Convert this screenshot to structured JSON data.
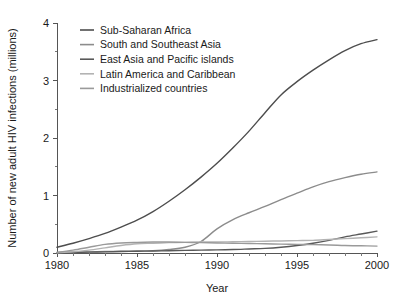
{
  "chart_data": {
    "type": "line",
    "title": "",
    "xlabel": "Year",
    "ylabel": "Number of new adult HIV infections (millions)",
    "xlim": [
      1980,
      2000
    ],
    "ylim": [
      0,
      4
    ],
    "grid": false,
    "legend_position": "top-left",
    "x_ticks": [
      "1980",
      "1985",
      "1990",
      "1995",
      "2000"
    ],
    "x_tick_values": [
      1980,
      1985,
      1990,
      1995,
      2000
    ],
    "x_minor_step": 1,
    "y_ticks": [
      "0",
      "1",
      "2",
      "3",
      "4"
    ],
    "y_tick_values": [
      0,
      1,
      2,
      3,
      4
    ],
    "y_minor_step": 0.5,
    "x": [
      1980,
      1981,
      1982,
      1983,
      1984,
      1985,
      1986,
      1987,
      1988,
      1989,
      1990,
      1991,
      1992,
      1993,
      1994,
      1995,
      1996,
      1997,
      1998,
      1999,
      2000
    ],
    "series": [
      {
        "name": "Sub-Saharan Africa",
        "color": "#4d4d4d",
        "values": [
          0.1,
          0.17,
          0.25,
          0.34,
          0.45,
          0.57,
          0.72,
          0.9,
          1.1,
          1.32,
          1.56,
          1.83,
          2.12,
          2.44,
          2.75,
          2.98,
          3.18,
          3.36,
          3.52,
          3.64,
          3.71
        ]
      },
      {
        "name": "South and Southeast Asia",
        "color": "#8c8c8c",
        "values": [
          0.01,
          0.015,
          0.02,
          0.025,
          0.03,
          0.035,
          0.04,
          0.06,
          0.1,
          0.2,
          0.42,
          0.58,
          0.7,
          0.81,
          0.93,
          1.04,
          1.15,
          1.24,
          1.31,
          1.37,
          1.41
        ]
      },
      {
        "name": "East Asia and Pacific islands",
        "color": "#595959",
        "values": [
          0.005,
          0.01,
          0.015,
          0.02,
          0.025,
          0.03,
          0.035,
          0.04,
          0.045,
          0.05,
          0.055,
          0.06,
          0.07,
          0.08,
          0.1,
          0.13,
          0.17,
          0.22,
          0.28,
          0.33,
          0.38
        ]
      },
      {
        "name": "Latin America and Caribbean",
        "color": "#b3b3b3",
        "values": [
          0.005,
          0.02,
          0.05,
          0.09,
          0.13,
          0.16,
          0.17,
          0.18,
          0.185,
          0.19,
          0.19,
          0.195,
          0.2,
          0.205,
          0.21,
          0.215,
          0.22,
          0.235,
          0.25,
          0.265,
          0.28
        ]
      },
      {
        "name": "Industrialized countries",
        "color": "#9a9a9a",
        "values": [
          0.01,
          0.05,
          0.1,
          0.15,
          0.175,
          0.185,
          0.19,
          0.19,
          0.185,
          0.18,
          0.175,
          0.17,
          0.165,
          0.16,
          0.155,
          0.15,
          0.145,
          0.14,
          0.13,
          0.125,
          0.12
        ]
      }
    ]
  },
  "legend": {
    "items": [
      "Sub-Saharan Africa",
      "South and Southeast Asia",
      "East Asia and Pacific islands",
      "Latin America and Caribbean",
      "Industrialized countries"
    ]
  }
}
